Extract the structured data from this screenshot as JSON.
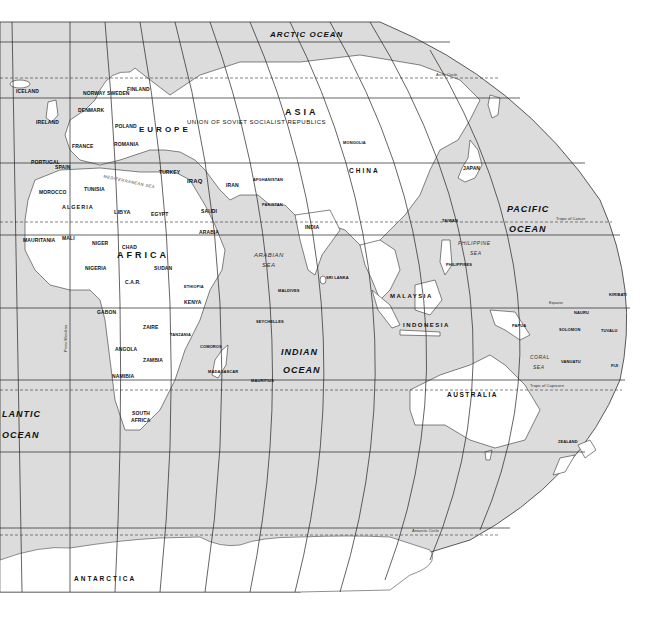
{
  "map": {
    "title": "World Map - Eastern Hemisphere",
    "colors": {
      "ocean": "#dcdcdc",
      "land": "#ffffff",
      "border": "#222222",
      "gridline": "#222222"
    },
    "oceans": {
      "arctic": "ARCTIC OCEAN",
      "pacific_1": "PACIFIC",
      "pacific_2": "OCEAN",
      "indian_1": "INDIAN",
      "indian_2": "OCEAN",
      "atlantic_1": "LANTIC",
      "atlantic_2": "OCEAN"
    },
    "seas": {
      "arabian_1": "ARABIAN",
      "arabian_2": "SEA",
      "philippine_1": "PHILIPPINE",
      "philippine_2": "SEA",
      "coral_1": "CORAL",
      "coral_2": "SEA",
      "mediterranean": "MEDITERRANEAN SEA"
    },
    "continents": {
      "asia": "ASIA",
      "europe": "EUROPE",
      "africa": "AFRICA",
      "australia": "AUSTRALIA",
      "antarctica": "ANTARCTICA"
    },
    "regions": {
      "ussr": "UNION   OF   SOVIET   SOCIALIST   REPUBLICS"
    },
    "countries": {
      "iceland": "ICELAND",
      "norway": "NORWAY",
      "sweden": "SWEDEN",
      "finland": "FINLAND",
      "uk": "UNITED KINGDOM",
      "ireland": "IRELAND",
      "denmark": "DENMARK",
      "neth": "NETH.",
      "germany": "GERMANY",
      "poland": "POLAND",
      "france": "FRANCE",
      "switz": "SWITZ.",
      "italy": "ITALY",
      "romania": "ROMANIA",
      "yugo": "YUGO.",
      "monaco": "MONACO",
      "andorra": "ANDORRA",
      "portugal": "PORTUGAL",
      "spain": "SPAIN",
      "turkey": "TURKEY",
      "cyprus": "CYPRUS",
      "malta": "MALTA",
      "syria": "SYRIA",
      "iraq": "IRAQ",
      "iran": "IRAN",
      "afghanistan": "AFGHANISTAN",
      "pakistan": "PAKISTAN",
      "jordan": "JORDAN",
      "kuwait": "KUWAIT",
      "bahrain": "BAHRAIN",
      "qatar": "QATAR",
      "saudi_1": "SAUDI",
      "saudi_2": "ARABIA",
      "oman": "OMAN",
      "yemen": "YEMEN",
      "mongolia": "MONGOLIA",
      "china": "CHINA",
      "n_kor": "N. KOR.",
      "s_kor": "S. KOR.",
      "japan": "JAPAN",
      "taiwan": "TAIWAN",
      "india": "INDIA",
      "nepal": "NEPAL",
      "bhutan": "BHU.",
      "bangl": "BANGL.",
      "myanmar": "MYANMAR",
      "thailand": "THAILAND",
      "camb": "CAMB.",
      "vietnam": "VIETNAM",
      "philippines": "PHILIPPINES",
      "sri_lanka": "SRI LANKA",
      "maldives": "MALDIVES",
      "brunei": "BRUNEI",
      "malaysia": "MALAYSIA",
      "singapore": "SINGAPORE",
      "indonesia": "INDONESIA",
      "png_1": "PAPUA",
      "png_2": "NEW",
      "png_3": "GUINEA",
      "solomon": "SOLOMON",
      "nauru": "NAURU",
      "kiribati": "KIRIBATI",
      "tuvalu": "TUVALU",
      "vanuatu": "VANUATU",
      "fiji": "FIJI",
      "new_zealand_1": "NEW",
      "new_zealand_2": "ZEALAND",
      "morocco": "MOROCCO",
      "algeria": "ALGERIA",
      "tunisia": "TUNISIA",
      "libya": "LIBYA",
      "egypt": "EGYPT",
      "mauritania": "MAURITANIA",
      "mali": "MALI",
      "niger": "NIGER",
      "chad": "CHAD",
      "sudan": "SUDAN",
      "senegal": "SENEGAL",
      "gambia": "GAMBIA",
      "guinea": "GUINEA",
      "sierra_leone": "SIERRA LEONE",
      "liberia": "LIBERIA",
      "ivory_coast": "IVORY COAST",
      "burkina": "BURKINA FASO",
      "nigeria": "NIGERIA",
      "togo": "TOGO",
      "sao_tome": "SÃO TOMÉ AND PRÍNCIPE",
      "eq_guinea": "EQ. GUI.",
      "cameroon": "CAMEROON",
      "car": "C.A.R.",
      "ethiopia": "ETHIOPIA",
      "somalia": "SOMALIA",
      "uganda": "UGANDA",
      "kenya": "KENYA",
      "gabon": "GABON",
      "zaire": "ZAIRE",
      "rwanda": "RWA.",
      "burundi": "BU.",
      "tanzania": "TANZANIA",
      "angola": "ANGOLA",
      "zambia": "ZAMBIA",
      "malawi": "MALAWI",
      "comoros": "COMOROS",
      "namibia": "NAMIBIA",
      "zimbabwe": "ZIMBABWE",
      "botswana": "BOTSWANA",
      "madagascar": "MADAGASCAR",
      "mauritius": "MAURITIUS",
      "swaziland": "SWA.",
      "lesotho": "LESO.",
      "south_africa_1": "SOUTH",
      "south_africa_2": "AFRICA",
      "seychelles": "SEYCHELLES"
    },
    "lines": {
      "arctic_circle": "Arctic Circle",
      "tropic_cancer": "Tropic of Cancer",
      "equator": "Equator",
      "tropic_capricorn": "Tropic of Capricorn",
      "antarctic_circle": "Antarctic Circle",
      "prime_meridian": "Prime Meridian"
    },
    "lat_ticks": [
      "60°",
      "40°",
      "20°",
      "0°",
      "20°",
      "40°",
      "60°"
    ]
  }
}
